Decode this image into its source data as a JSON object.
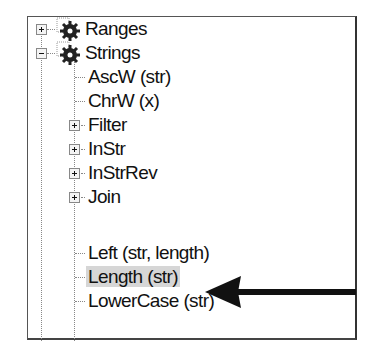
{
  "tree": {
    "nodes": [
      {
        "label": "Ranges",
        "level": 0,
        "expander": "plus",
        "icon": "gear-icon"
      },
      {
        "label": "Strings",
        "level": 0,
        "expander": "minus",
        "icon": "gear-icon"
      },
      {
        "label": "AscW (str)",
        "level": 1,
        "expander": null
      },
      {
        "label": "ChrW (x)",
        "level": 1,
        "expander": null
      },
      {
        "label": "Filter",
        "level": 1,
        "expander": "plus"
      },
      {
        "label": "InStr",
        "level": 1,
        "expander": "plus"
      },
      {
        "label": "InStrRev",
        "level": 1,
        "expander": "plus"
      },
      {
        "label": "Join",
        "level": 1,
        "expander": "plus"
      },
      {
        "label": "Left (str, length)",
        "level": 1,
        "expander": null
      },
      {
        "label": "Length (str)",
        "level": 1,
        "expander": null,
        "selected": true
      },
      {
        "label": "LowerCase (str)",
        "level": 1,
        "expander": null
      }
    ]
  },
  "annotation": {
    "type": "arrow",
    "points_to": "Length (str)",
    "color": "#111111"
  }
}
